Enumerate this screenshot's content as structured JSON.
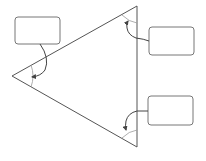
{
  "diagram": {
    "title": "",
    "shape": "triangle",
    "colors": {
      "stroke": "#555555",
      "arc": "#888888",
      "box_stroke": "#777777",
      "box_fill": "#ffffff",
      "background": "#ffffff"
    },
    "angle_labels": [
      {
        "vertex": "left",
        "text": ""
      },
      {
        "vertex": "top-right",
        "text": ""
      },
      {
        "vertex": "bottom-right",
        "text": ""
      }
    ]
  }
}
